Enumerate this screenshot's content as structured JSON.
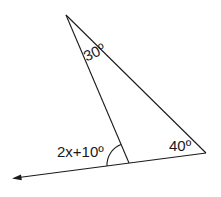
{
  "diagram": {
    "type": "triangle-exterior-angle",
    "stroke_color": "#1a1a1a",
    "angles": {
      "apex": "30º",
      "right_vertex": "40º",
      "exterior": "2x+10º"
    }
  }
}
